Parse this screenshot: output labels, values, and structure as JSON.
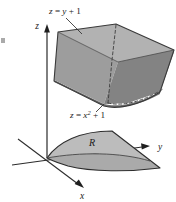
{
  "figure": {
    "labels": {
      "surface_top": {
        "lhs": "z",
        "eq": " = ",
        "rhs": "y",
        "plus": " + 1",
        "full": "z = y + 1"
      },
      "surface_front": {
        "lhs": "z",
        "eq": " = ",
        "rhs": "x",
        "exponent": "2",
        "plus": " + 1",
        "full": "z = x2 + 1"
      },
      "axis_x": "x",
      "axis_y": "y",
      "axis_z": "z",
      "region": "R"
    },
    "colors": {
      "background": "#ffffff",
      "ink": "#1a1a1a",
      "axis": "#2b2b2b",
      "surface_left": "#9a9a9a",
      "surface_left_dark": "#8b8b8b",
      "surface_right": "#7d7d7d",
      "surface_top_light": "#b4b4b4",
      "surface_back": "#a6a6a6",
      "region_fill": "#b9b9b9",
      "region_fill_lower": "#a8a8a8",
      "outline": "#3a3a3a",
      "hidden_edge": "#4a4a4a"
    },
    "geometry": {
      "projection": "oblique-3d",
      "origin": {
        "x": 47,
        "y": 158
      },
      "axis_z_tip": {
        "x": 47,
        "y": 26
      },
      "axis_y_tip": {
        "x": 150,
        "y": 147
      },
      "axis_x_tip": {
        "x": 84,
        "y": 190
      },
      "region_label_pos": {
        "x": 92,
        "y": 145
      },
      "hidden_edge_dashed": true
    }
  }
}
